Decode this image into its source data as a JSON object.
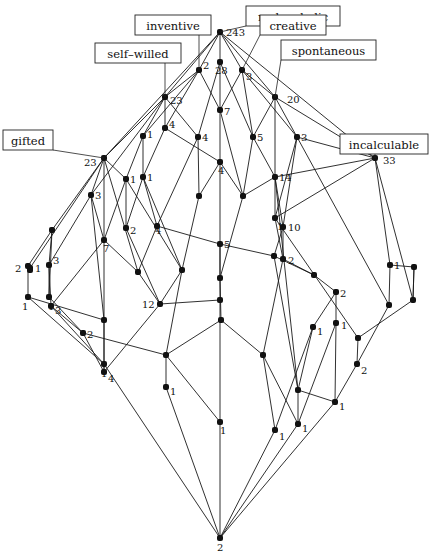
{
  "diagram": {
    "type": "concept-lattice",
    "attributes": [
      {
        "id": "melancholic",
        "label": "melancholic",
        "node": "top"
      },
      {
        "id": "inventive",
        "label": "inventive",
        "node": "inv"
      },
      {
        "id": "creative",
        "label": "creative",
        "node": "cre"
      },
      {
        "id": "self-willed",
        "label": "self–willed",
        "node": "sw"
      },
      {
        "id": "spontaneous",
        "label": "spontaneous",
        "node": "spo"
      },
      {
        "id": "gifted",
        "label": "gifted",
        "node": "gif"
      },
      {
        "id": "incalculable",
        "label": "incalculable",
        "node": "inc"
      }
    ],
    "nodes": [
      {
        "id": "top",
        "count": "243"
      },
      {
        "id": "inv",
        "count": "2"
      },
      {
        "id": "mid28",
        "count": "28"
      },
      {
        "id": "cre",
        "count": "3"
      },
      {
        "id": "sw",
        "count": "23"
      },
      {
        "id": "spo",
        "count": "20"
      },
      {
        "id": "gif",
        "count": "23"
      },
      {
        "id": "inc",
        "count": "33"
      },
      {
        "id": "n4a",
        "count": "4"
      },
      {
        "id": "n1a",
        "count": "1"
      },
      {
        "id": "n7a",
        "count": "7"
      },
      {
        "id": "n5a",
        "count": "5"
      },
      {
        "id": "n3a",
        "count": "3"
      },
      {
        "id": "n1b",
        "count": "1"
      },
      {
        "id": "n4b",
        "count": "4"
      },
      {
        "id": "n14",
        "count": "14"
      },
      {
        "id": "n4c",
        "count": "4"
      },
      {
        "id": "n3b",
        "count": "3"
      },
      {
        "id": "n1c",
        "count": "1"
      },
      {
        "id": "n2a",
        "count": "2"
      },
      {
        "id": "n4d",
        "count": "4"
      },
      {
        "id": "n1d",
        "count": "1"
      },
      {
        "id": "n10",
        "count": "10"
      },
      {
        "id": "n7b",
        "count": "7"
      },
      {
        "id": "n5b",
        "count": "5"
      },
      {
        "id": "n2b",
        "count": "2"
      },
      {
        "id": "n1e",
        "count": "1"
      },
      {
        "id": "n3c",
        "count": "3"
      },
      {
        "id": "n2c",
        "count": "2"
      },
      {
        "id": "n1f",
        "count": "1"
      },
      {
        "id": "n3d",
        "count": "3"
      },
      {
        "id": "n1g",
        "count": "1"
      },
      {
        "id": "n12",
        "count": "12"
      },
      {
        "id": "n2d",
        "count": "2"
      },
      {
        "id": "n1h",
        "count": "1"
      },
      {
        "id": "n2e",
        "count": "2"
      },
      {
        "id": "n1i",
        "count": "1"
      },
      {
        "id": "n1j",
        "count": "1"
      },
      {
        "id": "n4e",
        "count": "4"
      },
      {
        "id": "n1k",
        "count": "1"
      },
      {
        "id": "n1l",
        "count": "1"
      },
      {
        "id": "n2f",
        "count": "2"
      },
      {
        "id": "n1m",
        "count": "1"
      },
      {
        "id": "n1n",
        "count": "1"
      },
      {
        "id": "n1o",
        "count": "1"
      },
      {
        "id": "n1p",
        "count": "1"
      },
      {
        "id": "n1q",
        "count": "1"
      },
      {
        "id": "bottom",
        "count": "2"
      }
    ]
  }
}
